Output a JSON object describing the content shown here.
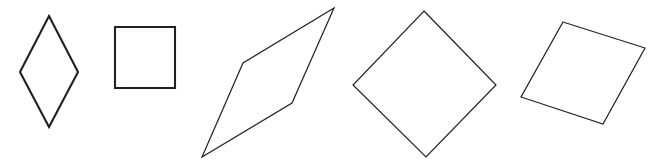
{
  "figure": {
    "background_color": "#ffffff",
    "stroke_color": "#231f20",
    "width": 665,
    "height": 168
  },
  "chart_data": {
    "type": "diagram",
    "xlabel": "",
    "ylabel": "",
    "xlim": [
      0,
      665
    ],
    "ylim": [
      0,
      168
    ],
    "grid": false,
    "legend": "none",
    "shapes": [
      {
        "name": "rhombus-tall",
        "label": "Tall rhombus",
        "stroke": "#231f20",
        "fill": "#ffffff",
        "stroke_width": 2.1,
        "points": "49,16 78,72 49,127 20,72"
      },
      {
        "name": "square-axis-aligned",
        "label": "Axis-aligned square",
        "stroke": "#231f20",
        "fill": "#ffffff",
        "stroke_width": 2.1,
        "points": "115,27 175,27 175,88 115,88"
      },
      {
        "name": "parallelogram-slanted",
        "label": "Slanted thin parallelogram",
        "stroke": "#231f20",
        "fill": "#ffffff",
        "stroke_width": 1.2,
        "points": "334,8 292,103 202,157 243,63"
      },
      {
        "name": "square-rotated-45",
        "label": "Square rotated 45 degrees",
        "stroke": "#231f20",
        "fill": "#ffffff",
        "stroke_width": 1.2,
        "points": "424,11 496,85 426,157 353,85"
      },
      {
        "name": "square-rotated-slight",
        "label": "Slightly rotated square",
        "stroke": "#231f20",
        "fill": "#ffffff",
        "stroke_width": 1.2,
        "points": "563,22 645,48 603,124 521,97"
      }
    ]
  }
}
